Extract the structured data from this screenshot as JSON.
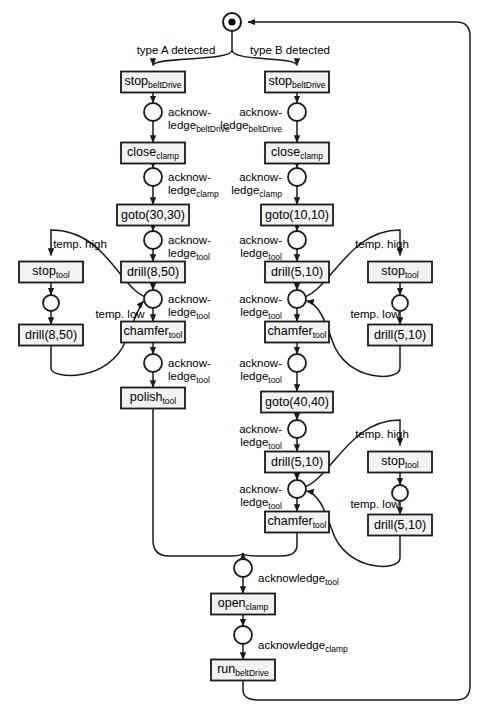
{
  "diagram": {
    "colors": {
      "stroke": "#1a1a1a",
      "fill": "#ffffff",
      "token": "#000000",
      "box_fill": "#f2f2f2"
    },
    "start_place": {
      "name": "start-place",
      "token": true,
      "cx": 232,
      "cy": 22,
      "r": 9
    },
    "branch_labels": [
      {
        "name": "branch-label-type-a",
        "text": "type A detected",
        "x": 176,
        "y": 44
      },
      {
        "name": "branch-label-type-b",
        "text": "type B detected",
        "x": 290,
        "y": 44
      }
    ],
    "transitions": [
      {
        "name": "stop-beltdrive-a",
        "label": "stop",
        "sub": "beltDrive",
        "x": 153,
        "y": 82,
        "w": 64,
        "h": 21
      },
      {
        "name": "close-clamp-a",
        "label": "close",
        "sub": "clamp",
        "x": 153,
        "y": 153,
        "w": 64,
        "h": 21
      },
      {
        "name": "goto-30-30",
        "label": "goto(30,30)",
        "sub": "",
        "x": 153,
        "y": 215,
        "w": 72,
        "h": 21
      },
      {
        "name": "drill-8-50-main",
        "label": "drill(8,50)",
        "sub": "",
        "x": 153,
        "y": 272,
        "w": 64,
        "h": 21
      },
      {
        "name": "chamfer-tool-a",
        "label": "chamfer",
        "sub": "tool",
        "x": 153,
        "y": 332,
        "w": 64,
        "h": 21
      },
      {
        "name": "polish-tool-a",
        "label": "polish",
        "sub": "tool",
        "x": 153,
        "y": 398,
        "w": 64,
        "h": 21
      },
      {
        "name": "stop-tool-left",
        "label": "stop",
        "sub": "tool",
        "x": 51,
        "y": 272,
        "w": 64,
        "h": 21
      },
      {
        "name": "drill-8-50-left",
        "label": "drill(8,50)",
        "sub": "",
        "x": 51,
        "y": 335,
        "w": 64,
        "h": 21
      },
      {
        "name": "stop-beltdrive-b",
        "label": "stop",
        "sub": "beltDrive",
        "x": 297,
        "y": 82,
        "w": 64,
        "h": 21
      },
      {
        "name": "close-clamp-b",
        "label": "close",
        "sub": "clamp",
        "x": 297,
        "y": 153,
        "w": 64,
        "h": 21
      },
      {
        "name": "goto-10-10",
        "label": "goto(10,10)",
        "sub": "",
        "x": 297,
        "y": 215,
        "w": 72,
        "h": 21
      },
      {
        "name": "drill-5-10-b1",
        "label": "drill(5,10)",
        "sub": "",
        "x": 297,
        "y": 272,
        "w": 64,
        "h": 21
      },
      {
        "name": "chamfer-tool-b1",
        "label": "chamfer",
        "sub": "tool",
        "x": 297,
        "y": 332,
        "w": 64,
        "h": 21
      },
      {
        "name": "goto-40-40",
        "label": "goto(40,40)",
        "sub": "",
        "x": 297,
        "y": 402,
        "w": 72,
        "h": 21
      },
      {
        "name": "drill-5-10-b2",
        "label": "drill(5,10)",
        "sub": "",
        "x": 297,
        "y": 462,
        "w": 64,
        "h": 21
      },
      {
        "name": "chamfer-tool-b2",
        "label": "chamfer",
        "sub": "tool",
        "x": 297,
        "y": 522,
        "w": 64,
        "h": 21
      },
      {
        "name": "stop-tool-right-1",
        "label": "stop",
        "sub": "tool",
        "x": 400,
        "y": 272,
        "w": 64,
        "h": 21
      },
      {
        "name": "drill-5-10-right-1",
        "label": "drill(5,10)",
        "sub": "",
        "x": 400,
        "y": 335,
        "w": 64,
        "h": 21
      },
      {
        "name": "stop-tool-right-2",
        "label": "stop",
        "sub": "tool",
        "x": 400,
        "y": 462,
        "w": 64,
        "h": 21
      },
      {
        "name": "drill-5-10-right-2",
        "label": "drill(5,10)",
        "sub": "",
        "x": 400,
        "y": 525,
        "w": 64,
        "h": 21
      },
      {
        "name": "open-clamp",
        "label": "open",
        "sub": "clamp",
        "x": 243,
        "y": 604,
        "w": 64,
        "h": 21
      },
      {
        "name": "run-beltdrive",
        "label": "run",
        "sub": "beltDrive",
        "x": 243,
        "y": 670,
        "w": 64,
        "h": 21
      }
    ],
    "places": [
      {
        "name": "place-ack-beltdrive-a",
        "cx": 153,
        "cy": 112,
        "r": 9
      },
      {
        "name": "place-ack-clamp-a",
        "cx": 153,
        "cy": 177,
        "r": 9
      },
      {
        "name": "place-ack-tool-a1",
        "cx": 153,
        "cy": 240,
        "r": 9
      },
      {
        "name": "place-ack-tool-a2",
        "cx": 153,
        "cy": 299,
        "r": 9
      },
      {
        "name": "place-ack-tool-a3",
        "cx": 153,
        "cy": 363,
        "r": 9
      },
      {
        "name": "place-left-loop",
        "cx": 51,
        "cy": 303,
        "r": 8
      },
      {
        "name": "place-ack-beltdrive-b",
        "cx": 297,
        "cy": 112,
        "r": 9
      },
      {
        "name": "place-ack-clamp-b",
        "cx": 297,
        "cy": 177,
        "r": 9
      },
      {
        "name": "place-ack-tool-b1",
        "cx": 297,
        "cy": 240,
        "r": 9
      },
      {
        "name": "place-ack-tool-b2",
        "cx": 297,
        "cy": 299,
        "r": 9
      },
      {
        "name": "place-ack-tool-b3",
        "cx": 297,
        "cy": 363,
        "r": 9
      },
      {
        "name": "place-ack-tool-b4",
        "cx": 297,
        "cy": 429,
        "r": 9
      },
      {
        "name": "place-ack-tool-b5",
        "cx": 297,
        "cy": 489,
        "r": 9
      },
      {
        "name": "place-right-loop-1",
        "cx": 400,
        "cy": 303,
        "r": 8
      },
      {
        "name": "place-right-loop-2",
        "cx": 400,
        "cy": 493,
        "r": 8
      },
      {
        "name": "place-ack-tool-final",
        "cx": 243,
        "cy": 568,
        "r": 9
      },
      {
        "name": "place-ack-clamp-final",
        "cx": 243,
        "cy": 635,
        "r": 9
      }
    ],
    "place_labels": [
      {
        "name": "label-ack-beltdrive-a",
        "line1": "acknow-",
        "line2": "ledge",
        "sub": "beltDrive",
        "x": 168,
        "y": 106,
        "align": "left"
      },
      {
        "name": "label-ack-clamp-a",
        "line1": "acknow-",
        "line2": "ledge",
        "sub": "clamp",
        "x": 168,
        "y": 171,
        "align": "left"
      },
      {
        "name": "label-ack-tool-a1",
        "line1": "acknow-",
        "line2": "ledge",
        "sub": "tool",
        "x": 168,
        "y": 234,
        "align": "left"
      },
      {
        "name": "label-ack-tool-a2",
        "line1": "acknow-",
        "line2": "ledge",
        "sub": "tool",
        "x": 168,
        "y": 293,
        "align": "left"
      },
      {
        "name": "label-ack-tool-a3",
        "line1": "acknow-",
        "line2": "ledge",
        "sub": "tool",
        "x": 168,
        "y": 357,
        "align": "left"
      },
      {
        "name": "label-ack-beltdrive-b",
        "line1": "acknow-",
        "line2": "ledge",
        "sub": "beltDrive",
        "x": 282,
        "y": 106,
        "align": "right"
      },
      {
        "name": "label-ack-clamp-b",
        "line1": "acknow-",
        "line2": "ledge",
        "sub": "clamp",
        "x": 282,
        "y": 171,
        "align": "right"
      },
      {
        "name": "label-ack-tool-b1",
        "line1": "acknow-",
        "line2": "ledge",
        "sub": "tool",
        "x": 282,
        "y": 234,
        "align": "right"
      },
      {
        "name": "label-ack-tool-b2",
        "line1": "acknow-",
        "line2": "ledge",
        "sub": "tool",
        "x": 282,
        "y": 293,
        "align": "right"
      },
      {
        "name": "label-ack-tool-b3",
        "line1": "acknow-",
        "line2": "ledge",
        "sub": "tool",
        "x": 282,
        "y": 357,
        "align": "right"
      },
      {
        "name": "label-ack-tool-b4",
        "line1": "acknow-",
        "line2": "ledge",
        "sub": "tool",
        "x": 282,
        "y": 423,
        "align": "right"
      },
      {
        "name": "label-ack-tool-b5",
        "line1": "acknow-",
        "line2": "ledge",
        "sub": "tool",
        "x": 282,
        "y": 483,
        "align": "right"
      }
    ],
    "single_line_labels": [
      {
        "name": "label-ack-tool-final",
        "text": "acknowledge",
        "sub": "tool",
        "x": 258,
        "y": 572
      },
      {
        "name": "label-ack-clamp-final",
        "text": "acknowledge",
        "sub": "clamp",
        "x": 258,
        "y": 639
      }
    ],
    "temp_labels": [
      {
        "name": "temp-high-left",
        "text": "temp. high",
        "x": 80,
        "y": 238
      },
      {
        "name": "temp-low-left",
        "text": "temp. low",
        "x": 120,
        "y": 308
      },
      {
        "name": "temp-high-right-1",
        "text": "temp. high",
        "x": 382,
        "y": 238
      },
      {
        "name": "temp-low-right-1",
        "text": "temp. low",
        "x": 375,
        "y": 308
      },
      {
        "name": "temp-high-right-2",
        "text": "temp. high",
        "x": 382,
        "y": 428
      },
      {
        "name": "temp-low-right-2",
        "text": "temp. low",
        "x": 375,
        "y": 498
      }
    ]
  }
}
